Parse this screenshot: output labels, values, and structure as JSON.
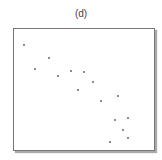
{
  "chart_data": {
    "type": "scatter",
    "title": "(d)",
    "xlabel": "",
    "ylabel": "",
    "grid": false,
    "legend": null,
    "points": [
      {
        "x": 24,
        "y": 45
      },
      {
        "x": 35,
        "y": 69
      },
      {
        "x": 49,
        "y": 58
      },
      {
        "x": 58,
        "y": 76
      },
      {
        "x": 71,
        "y": 71
      },
      {
        "x": 84,
        "y": 72
      },
      {
        "x": 78,
        "y": 90
      },
      {
        "x": 93,
        "y": 82
      },
      {
        "x": 101,
        "y": 101
      },
      {
        "x": 118,
        "y": 96
      },
      {
        "x": 115,
        "y": 120
      },
      {
        "x": 128,
        "y": 118
      },
      {
        "x": 123,
        "y": 130
      },
      {
        "x": 128,
        "y": 138
      },
      {
        "x": 110,
        "y": 142
      }
    ]
  }
}
